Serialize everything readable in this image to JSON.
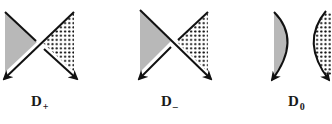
{
  "figure": {
    "panels": [
      {
        "id": "D+",
        "label_main": "D",
        "label_sub": "+",
        "description": "Crossing with gray-shaded triangle on left and dotted triangle on right; strand from top-right to bottom-left passes over"
      },
      {
        "id": "D-",
        "label_main": "D",
        "label_sub": "–",
        "description": "Crossing with gray-shaded triangle on left and dotted triangle on right; strand from top-left to bottom-right passes over"
      },
      {
        "id": "D0",
        "label_main": "D",
        "label_sub": "0",
        "description": "Smoothing: two separate arcs, gray region on left and dotted region on right"
      }
    ],
    "colors": {
      "stroke": "#111111",
      "gray_fill": "#b8b8b8",
      "dot_fill": "#111111",
      "background": "#ffffff"
    }
  }
}
